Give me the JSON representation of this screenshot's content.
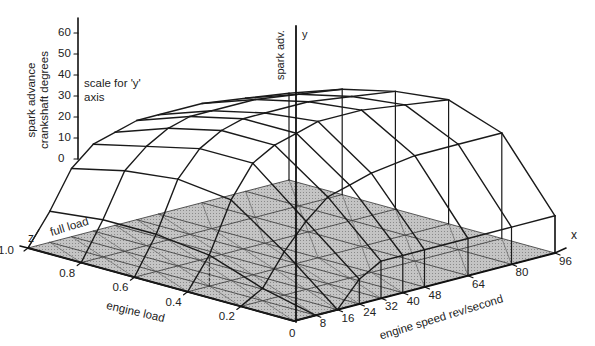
{
  "chart_data": {
    "type": "surface3d",
    "xlabel": "engine speed rev/second",
    "zlabel": "engine load",
    "ylabel": "spark adv.",
    "y_scale_label": "spark advance crankshaft degrees",
    "y_scale_note": "scale for 'y' axis",
    "full_load_label": "full load",
    "axis_letters": {
      "x": "x",
      "y": "y",
      "z": "z"
    },
    "x_ticks": [
      0,
      8,
      16,
      24,
      32,
      40,
      48,
      64,
      80,
      96
    ],
    "z_ticks": [
      0,
      0.2,
      0.4,
      0.6,
      0.8,
      1.0
    ],
    "z_tick_labels": [
      "0",
      "0.2",
      "0.4",
      "0.6",
      "0.8",
      "1.0"
    ],
    "y_ticks": [
      0,
      10,
      20,
      30,
      40,
      50,
      60
    ],
    "ylim": [
      0,
      65
    ],
    "x": [
      0,
      8,
      16,
      24,
      32,
      40,
      48,
      64,
      80,
      96
    ],
    "z": [
      0,
      0.2,
      0.4,
      0.6,
      0.8,
      1.0
    ],
    "y_values_by_load": [
      [
        0,
        0,
        0,
        8,
        12,
        12,
        12,
        12,
        12,
        12
      ],
      [
        0,
        4,
        14,
        22,
        28,
        30,
        32,
        34,
        34,
        34
      ],
      [
        0,
        10,
        26,
        36,
        40,
        42,
        44,
        44,
        42,
        40
      ],
      [
        0,
        12,
        28,
        36,
        40,
        42,
        42,
        42,
        40,
        38
      ],
      [
        0,
        12,
        26,
        32,
        36,
        38,
        38,
        38,
        36,
        34
      ],
      [
        0,
        10,
        22,
        28,
        30,
        32,
        32,
        32,
        30,
        28
      ]
    ],
    "base_plane_color": "#b8b8b8",
    "line_color": "#1a1a1a"
  }
}
